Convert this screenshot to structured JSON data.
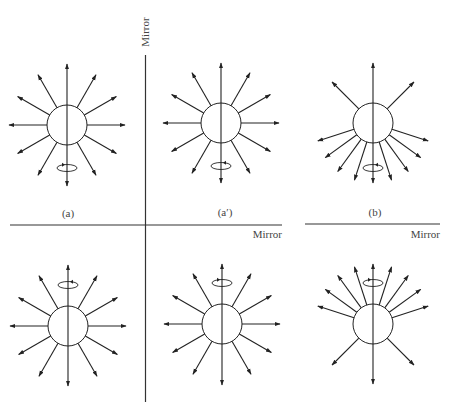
{
  "figure": {
    "width": 451,
    "height": 408,
    "ink_color": "#222222",
    "mirror_color": "#333333",
    "label_color": "#555555"
  },
  "mirrors": [
    {
      "id": "vertical-mirror",
      "orientation": "vertical",
      "x1": 145.5,
      "y1": 55,
      "x2": 145.5,
      "y2": 402,
      "label": "Mirror",
      "label_x": 149,
      "label_y": 32,
      "label_rotate": -90
    },
    {
      "id": "horizontal-mirror-a",
      "orientation": "horizontal",
      "x1": 10,
      "y1": 225,
      "x2": 282,
      "y2": 225,
      "label": "Mirror",
      "label_x": 282,
      "label_y": 238
    },
    {
      "id": "horizontal-mirror-b",
      "orientation": "horizontal",
      "x1": 305,
      "y1": 224,
      "x2": 440,
      "y2": 224,
      "label": "Mirror",
      "label_x": 440,
      "label_y": 238
    }
  ],
  "panel_labels": [
    {
      "text": "(a)",
      "x": 68,
      "y": 217
    },
    {
      "text": "(a′)",
      "x": 225,
      "y": 216
    },
    {
      "text": "(b)",
      "x": 375,
      "y": 216
    }
  ],
  "panels": [
    {
      "id": "panel-a",
      "cx": 67,
      "cy": 125,
      "r": 20,
      "spin": {
        "cy": 168,
        "arrow": "right"
      },
      "rays": [
        {
          "angle": 90,
          "len": 61
        },
        {
          "angle": 270,
          "len": 61
        },
        {
          "angle": 0,
          "len": 58
        },
        {
          "angle": 180,
          "len": 58
        },
        {
          "angle": 30,
          "len": 57
        },
        {
          "angle": 60,
          "len": 58
        },
        {
          "angle": 120,
          "len": 58
        },
        {
          "angle": 150,
          "len": 57
        },
        {
          "angle": 210,
          "len": 57
        },
        {
          "angle": 240,
          "len": 58
        },
        {
          "angle": 300,
          "len": 58
        },
        {
          "angle": 330,
          "len": 57
        }
      ]
    },
    {
      "id": "panel-a-prime",
      "cx": 221,
      "cy": 123,
      "r": 20,
      "spin": {
        "cy": 166,
        "arrow": "left"
      },
      "rays": [
        {
          "angle": 90,
          "len": 60
        },
        {
          "angle": 270,
          "len": 60
        },
        {
          "angle": 0,
          "len": 58
        },
        {
          "angle": 180,
          "len": 58
        },
        {
          "angle": 30,
          "len": 57
        },
        {
          "angle": 60,
          "len": 58
        },
        {
          "angle": 120,
          "len": 58
        },
        {
          "angle": 150,
          "len": 57
        },
        {
          "angle": 210,
          "len": 57
        },
        {
          "angle": 240,
          "len": 58
        },
        {
          "angle": 300,
          "len": 58
        },
        {
          "angle": 330,
          "len": 57
        }
      ]
    },
    {
      "id": "panel-b",
      "cx": 373,
      "cy": 123,
      "r": 20,
      "spin": {
        "cy": 168,
        "arrow": "left"
      },
      "rays": [
        {
          "angle": 90,
          "len": 60
        },
        {
          "angle": 45,
          "len": 58
        },
        {
          "angle": 135,
          "len": 58
        },
        {
          "angle": 270,
          "len": 60
        },
        {
          "angle": 198,
          "len": 58
        },
        {
          "angle": 216,
          "len": 59
        },
        {
          "angle": 234,
          "len": 60
        },
        {
          "angle": 252,
          "len": 60
        },
        {
          "angle": 288,
          "len": 60
        },
        {
          "angle": 306,
          "len": 60
        },
        {
          "angle": 324,
          "len": 59
        },
        {
          "angle": 342,
          "len": 58
        }
      ]
    },
    {
      "id": "panel-a-reflected",
      "cx": 68,
      "cy": 326,
      "r": 20,
      "spin": {
        "cy": 285,
        "arrow": "left"
      },
      "rays": [
        {
          "angle": 90,
          "len": 61
        },
        {
          "angle": 270,
          "len": 60
        },
        {
          "angle": 0,
          "len": 58
        },
        {
          "angle": 180,
          "len": 58
        },
        {
          "angle": 30,
          "len": 57
        },
        {
          "angle": 60,
          "len": 58
        },
        {
          "angle": 120,
          "len": 58
        },
        {
          "angle": 150,
          "len": 57
        },
        {
          "angle": 210,
          "len": 57
        },
        {
          "angle": 240,
          "len": 58
        },
        {
          "angle": 300,
          "len": 58
        },
        {
          "angle": 330,
          "len": 57
        }
      ]
    },
    {
      "id": "panel-a-prime-reflected",
      "cx": 222,
      "cy": 324,
      "r": 20,
      "spin": {
        "cy": 283,
        "arrow": "right"
      },
      "rays": [
        {
          "angle": 90,
          "len": 60
        },
        {
          "angle": 270,
          "len": 61
        },
        {
          "angle": 0,
          "len": 58
        },
        {
          "angle": 180,
          "len": 58
        },
        {
          "angle": 30,
          "len": 57
        },
        {
          "angle": 60,
          "len": 58
        },
        {
          "angle": 120,
          "len": 58
        },
        {
          "angle": 150,
          "len": 57
        },
        {
          "angle": 210,
          "len": 57
        },
        {
          "angle": 240,
          "len": 58
        },
        {
          "angle": 300,
          "len": 58
        },
        {
          "angle": 330,
          "len": 57
        }
      ]
    },
    {
      "id": "panel-b-reflected",
      "cx": 373,
      "cy": 324,
      "r": 20,
      "spin": {
        "cy": 283,
        "arrow": "right"
      },
      "rays": [
        {
          "angle": 90,
          "len": 60
        },
        {
          "angle": 225,
          "len": 58
        },
        {
          "angle": 315,
          "len": 58
        },
        {
          "angle": 270,
          "len": 60
        },
        {
          "angle": 162,
          "len": 58
        },
        {
          "angle": 144,
          "len": 59
        },
        {
          "angle": 126,
          "len": 60
        },
        {
          "angle": 108,
          "len": 60
        },
        {
          "angle": 72,
          "len": 60
        },
        {
          "angle": 54,
          "len": 60
        },
        {
          "angle": 36,
          "len": 59
        },
        {
          "angle": 18,
          "len": 58
        }
      ]
    }
  ]
}
